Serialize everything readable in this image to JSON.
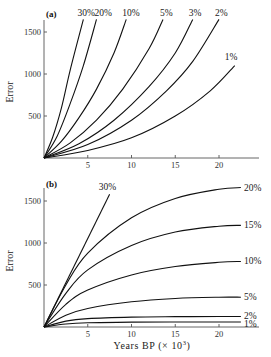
{
  "chart_data": [
    {
      "type": "line",
      "panel_label": "(a)",
      "title": "",
      "xlabel": "",
      "ylabel": "Error",
      "xlim": [
        0,
        24
      ],
      "ylim": [
        0,
        1650
      ],
      "x_ticks": [
        5,
        10,
        15,
        20
      ],
      "y_ticks": [
        500,
        1000,
        1500
      ],
      "grid": false,
      "legend": "inline labels at curve ends",
      "series": [
        {
          "name": "30%",
          "x": [
            0,
            1,
            2,
            3,
            4.5
          ],
          "y": [
            0,
            250,
            600,
            1050,
            1650
          ]
        },
        {
          "name": "20%",
          "x": [
            0,
            1.5,
            3,
            4.5,
            6
          ],
          "y": [
            0,
            260,
            650,
            1100,
            1650
          ]
        },
        {
          "name": "10%",
          "x": [
            0,
            2,
            4,
            6,
            8,
            9.4
          ],
          "y": [
            0,
            200,
            480,
            820,
            1250,
            1650
          ]
        },
        {
          "name": "5%",
          "x": [
            0,
            3,
            6,
            9,
            12,
            13.6
          ],
          "y": [
            0,
            180,
            450,
            820,
            1300,
            1650
          ]
        },
        {
          "name": "3%",
          "x": [
            0,
            4,
            8,
            12,
            15,
            17
          ],
          "y": [
            0,
            170,
            450,
            850,
            1250,
            1650
          ]
        },
        {
          "name": "2%",
          "x": [
            0,
            5,
            10,
            14,
            17,
            20
          ],
          "y": [
            0,
            160,
            450,
            800,
            1150,
            1650
          ]
        },
        {
          "name": "1%",
          "x": [
            0,
            5,
            10,
            15,
            19,
            21.8
          ],
          "y": [
            0,
            90,
            240,
            500,
            800,
            1100
          ]
        }
      ]
    },
    {
      "type": "line",
      "panel_label": "(b)",
      "title": "",
      "xlabel": "Years BP (× 10³)",
      "ylabel": "Error",
      "xlim": [
        0,
        24
      ],
      "ylim": [
        0,
        1650
      ],
      "x_ticks": [
        5,
        10,
        15,
        20
      ],
      "y_ticks": [
        500,
        1000,
        1500
      ],
      "grid": false,
      "legend": "inline labels at curve ends",
      "series": [
        {
          "name": "30%",
          "x": [
            0,
            7.5
          ],
          "y": [
            0,
            1580
          ]
        },
        {
          "name": "20%",
          "x": [
            0,
            2.5,
            5,
            10,
            15,
            20,
            22.5
          ],
          "y": [
            0,
            500,
            880,
            1300,
            1530,
            1640,
            1660
          ]
        },
        {
          "name": "15%",
          "x": [
            0,
            2.5,
            5,
            10,
            15,
            20,
            22.5
          ],
          "y": [
            0,
            400,
            680,
            970,
            1130,
            1200,
            1210
          ]
        },
        {
          "name": "10%",
          "x": [
            0,
            2.5,
            5,
            10,
            15,
            20,
            22.5
          ],
          "y": [
            0,
            270,
            440,
            620,
            720,
            770,
            780
          ]
        },
        {
          "name": "5%",
          "x": [
            0,
            2.5,
            5,
            10,
            15,
            20,
            22.5
          ],
          "y": [
            0,
            140,
            220,
            300,
            340,
            355,
            355
          ]
        },
        {
          "name": "2%",
          "x": [
            0,
            2.5,
            5,
            10,
            15,
            20,
            22.5
          ],
          "y": [
            0,
            70,
            100,
            118,
            123,
            125,
            125
          ]
        },
        {
          "name": "1%",
          "x": [
            0,
            2.5,
            5,
            10,
            15,
            20,
            22.5
          ],
          "y": [
            0,
            35,
            50,
            58,
            60,
            60,
            60
          ]
        }
      ]
    }
  ],
  "labels": {
    "panel_a": "(a)",
    "panel_b": "(b)",
    "ylabel": "Error",
    "xlabel_b": "Years BP (× 10",
    "xlabel_b_sup": "3",
    "xlabel_b_close": ")",
    "x_ticks": [
      "5",
      "10",
      "15",
      "20"
    ],
    "y_ticks": [
      "500",
      "1000",
      "1500"
    ]
  }
}
